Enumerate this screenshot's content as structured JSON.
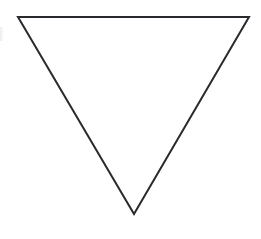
{
  "figure": {
    "shape_name": "triangle",
    "orientation": "point-down",
    "description": "Black outlined triangle pointing downward on a plain white background",
    "canvas": {
      "width": 261,
      "height": 239,
      "background_color": "#ffffff"
    },
    "stroke": {
      "color": "#2a2a2e",
      "width": 2,
      "linejoin": "miter",
      "linecap": "butt",
      "fill": "none"
    },
    "vertices": [
      {
        "label": "top-left",
        "x": 18,
        "y": 17
      },
      {
        "label": "top-right",
        "x": 249,
        "y": 17
      },
      {
        "label": "bottom-apex",
        "x": 134,
        "y": 214
      }
    ],
    "path_d": "M 18 17 L 249 17 L 134 214 Z",
    "measurements": {
      "top_edge_length_px": 231,
      "height_px": 197,
      "apex_offset_from_left_px": 116
    },
    "artifacts": {
      "left_edge_smudge": {
        "present": true,
        "color": "#e9e9ec",
        "x": 0,
        "y": 27,
        "width": 4,
        "height": 14
      }
    }
  }
}
